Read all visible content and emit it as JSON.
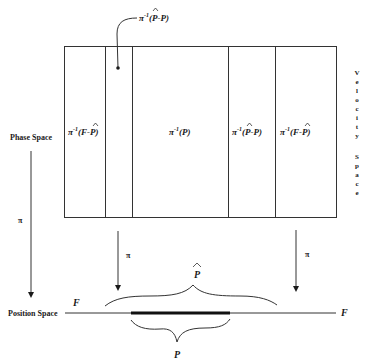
{
  "labels": {
    "phase_space": "Phase Space",
    "position_space": "Position Space",
    "velocity_space_letters": [
      "V",
      "e",
      "l",
      "o",
      "c",
      "i",
      "t",
      "y",
      "",
      "S",
      "p",
      "a",
      "c",
      "e"
    ],
    "pi": "π",
    "F_left": "F",
    "F_right": "F",
    "P_hat": "P",
    "P": "P"
  },
  "regions": [
    {
      "name": "region-f-minus-phat-left",
      "prefix": "π",
      "sup": "-1",
      "body_pre": "(F-",
      "hat_letter": "P",
      "body_post": ")"
    },
    {
      "name": "region-phat-minus-p-left",
      "prefix": "",
      "sup": "",
      "body_pre": "",
      "hat_letter": "",
      "body_post": ""
    },
    {
      "name": "region-p",
      "prefix": "π",
      "sup": "-1",
      "body_pre": "(P)",
      "hat_letter": "",
      "body_post": ""
    },
    {
      "name": "region-phat-minus-p-right",
      "prefix": "π",
      "sup": "-1",
      "body_pre": "(",
      "hat_letter": "P",
      "body_post": "-P)"
    },
    {
      "name": "region-f-minus-phat-right",
      "prefix": "π",
      "sup": "-1",
      "body_pre": "(F-",
      "hat_letter": "P",
      "body_post": ")"
    }
  ],
  "callout": {
    "prefix": "π",
    "sup": "-1",
    "body_pre": "(",
    "hat_letter": "P",
    "body_post": "-P)"
  },
  "colors": {
    "ink": "#333333",
    "background": "#ffffff"
  }
}
